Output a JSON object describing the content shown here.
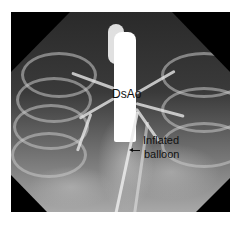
{
  "image": {
    "description": "Angiographic X-ray (aortogram) with contrast-filled descending aorta and an inflated balloon catheter",
    "shape": "octagon-cropped"
  },
  "annotations": {
    "vessel_label": "DsAo",
    "balloon_label_line1": "Inflated",
    "balloon_label_line2": "balloon"
  },
  "colors": {
    "background": "#ffffff",
    "mask": "#000000",
    "label_text": "#111111",
    "contrast": "#ffffff"
  }
}
